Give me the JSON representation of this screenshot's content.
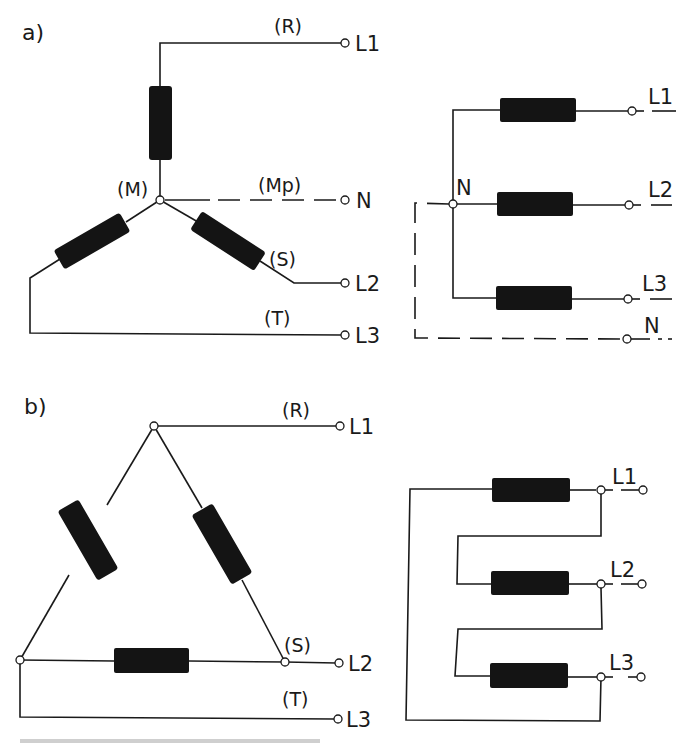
{
  "figure": {
    "panel_a": {
      "label": "a)",
      "star": {
        "phase_r": "(R)",
        "phase_s": "(S)",
        "phase_t": "(T)",
        "star_point": "(M)",
        "neutral_point": "(Mp)",
        "terminals": {
          "l1": "L1",
          "n": "N",
          "l2": "L2",
          "l3": "L3"
        }
      },
      "schematic": {
        "neutral_label": "N",
        "terminals": {
          "l1": "L1",
          "l2": "L2",
          "l3": "L3",
          "n": "N"
        }
      }
    },
    "panel_b": {
      "label": "b)",
      "delta": {
        "phase_r": "(R)",
        "phase_s": "(S)",
        "phase_t": "(T)",
        "terminals": {
          "l1": "L1",
          "l2": "L2",
          "l3": "L3"
        }
      },
      "schematic": {
        "terminals": {
          "l1": "L1",
          "l2": "L2",
          "l3": "L3"
        }
      }
    }
  },
  "colors": {
    "ink": "#1a1a1a",
    "background": "#ffffff"
  }
}
